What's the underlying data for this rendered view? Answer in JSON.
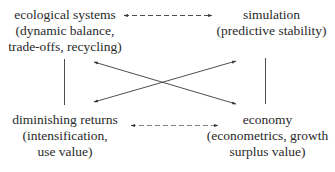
{
  "diagram": {
    "nodes": {
      "ecological": {
        "title": "ecological systems",
        "line2": "(dynamic balance,",
        "line3": "trade-offs, recycling)"
      },
      "simulation": {
        "title": "simulation",
        "line2": "(predictive stability)"
      },
      "diminishing": {
        "title": "diminishing returns",
        "line2": "(intensification,",
        "line3": "use value)"
      },
      "economy": {
        "title": "economy",
        "line2": "(econometrics, growth",
        "line3": "surplus value)"
      }
    },
    "edges": [
      {
        "from": "ecological systems",
        "to": "simulation",
        "style": "dashed",
        "arrows": "both"
      },
      {
        "from": "diminishing returns",
        "to": "economy",
        "style": "dashed",
        "arrows": "both"
      },
      {
        "from": "ecological systems",
        "to": "diminishing returns",
        "style": "solid",
        "arrows": "none"
      },
      {
        "from": "simulation",
        "to": "economy",
        "style": "solid",
        "arrows": "none"
      },
      {
        "from": "ecological systems",
        "to": "economy",
        "style": "solid",
        "arrows": "both"
      },
      {
        "from": "diminishing returns",
        "to": "simulation",
        "style": "solid",
        "arrows": "both"
      }
    ],
    "colors": {
      "text": "#2a2a2a",
      "line": "#3a3a3a",
      "background": "#ffffff"
    }
  }
}
